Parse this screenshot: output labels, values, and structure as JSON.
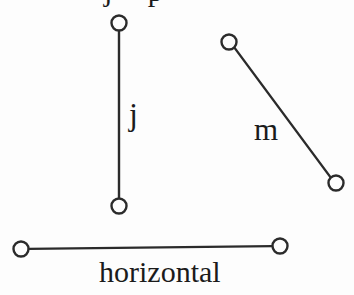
{
  "figure": {
    "background_color": "#fdfdfd",
    "stroke_color": "#2b2b2b",
    "label_color": "#1b1b1b",
    "width": 354,
    "height": 295,
    "top_cropped_text": "j p"
  },
  "segments": [
    {
      "id": "j",
      "label": "j",
      "orientation": "vertical",
      "label_position": {
        "x": 129,
        "y": 98
      },
      "endpoints": [
        {
          "name": "j-endpoint-top",
          "x": 119,
          "y": 23
        },
        {
          "name": "j-endpoint-bottom",
          "x": 119,
          "y": 206
        }
      ],
      "endpoint_radius": 7.5
    },
    {
      "id": "m",
      "label": "m",
      "orientation": "diagonal",
      "label_position": {
        "x": 254,
        "y": 114
      },
      "endpoints": [
        {
          "name": "m-endpoint-upper-left",
          "x": 229,
          "y": 42
        },
        {
          "name": "m-endpoint-lower-right",
          "x": 336,
          "y": 183
        }
      ],
      "endpoint_radius": 7.5
    },
    {
      "id": "horizontal",
      "label": "horizontal",
      "orientation": "horizontal",
      "label_position": {
        "x": 99,
        "y": 257
      },
      "endpoints": [
        {
          "name": "horizontal-endpoint-left",
          "x": 21,
          "y": 249
        },
        {
          "name": "horizontal-endpoint-right",
          "x": 280,
          "y": 246
        }
      ],
      "endpoint_radius": 7.5
    }
  ],
  "labels": {
    "j": "j",
    "m": "m",
    "horizontal": "horizontal"
  }
}
